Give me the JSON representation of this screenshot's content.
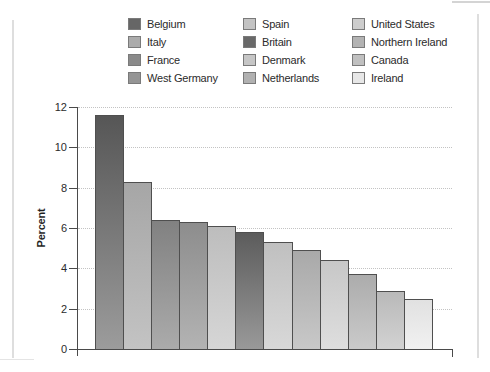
{
  "figure": {
    "ylabel": "Percent"
  },
  "legend": {
    "columns": [
      [
        "Belgium",
        "Italy",
        "France",
        "West Germany"
      ],
      [
        "Spain",
        "Britain",
        "Denmark",
        "Netherlands"
      ],
      [
        "United States",
        "Northern Ireland",
        "Canada",
        "Ireland"
      ]
    ]
  },
  "colors": {
    "Belgium": {
      "swatch": "#666666",
      "bar_top": "#565656",
      "bar_bottom": "#9c9c9c"
    },
    "Italy": {
      "swatch": "#ababab",
      "bar_top": "#a6a6a6",
      "bar_bottom": "#c3c3c3"
    },
    "France": {
      "swatch": "#8a8a8a",
      "bar_top": "#818181",
      "bar_bottom": "#ababab"
    },
    "West Germany": {
      "swatch": "#959595",
      "bar_top": "#8d8d8d",
      "bar_bottom": "#b3b3b3"
    },
    "Spain": {
      "swatch": "#c3c3c3",
      "bar_top": "#bdbdbd",
      "bar_bottom": "#d6d6d6"
    },
    "Britain": {
      "swatch": "#696969",
      "bar_top": "#5c5c5c",
      "bar_bottom": "#999999"
    },
    "Denmark": {
      "swatch": "#c6c6c6",
      "bar_top": "#c0c0c0",
      "bar_bottom": "#d8d8d8"
    },
    "Netherlands": {
      "swatch": "#b1b1b1",
      "bar_top": "#a9a9a9",
      "bar_bottom": "#c8c8c8"
    },
    "United States": {
      "swatch": "#cdcdcd",
      "bar_top": "#c7c7c7",
      "bar_bottom": "#dedede"
    },
    "Northern Ireland": {
      "swatch": "#b3b3b3",
      "bar_top": "#acacac",
      "bar_bottom": "#cacaca"
    },
    "Canada": {
      "swatch": "#c0c0c0",
      "bar_top": "#b9b9b9",
      "bar_bottom": "#d2d2d2"
    },
    "Ireland": {
      "swatch": "#e7e7e7",
      "bar_top": "#e1e1e1",
      "bar_bottom": "#f1f1f1"
    }
  },
  "chart_data": {
    "type": "bar",
    "categories": [
      "Belgium",
      "Italy",
      "France",
      "West Germany",
      "Spain",
      "Britain",
      "Denmark",
      "Netherlands",
      "United States",
      "Northern Ireland",
      "Canada",
      "Ireland"
    ],
    "values": [
      11.6,
      8.3,
      6.4,
      6.3,
      6.1,
      5.8,
      5.3,
      4.9,
      4.4,
      3.7,
      2.9,
      2.5
    ],
    "title": "",
    "xlabel": "",
    "ylabel": "Percent",
    "ylim": [
      0,
      12
    ],
    "yticks": [
      0,
      2,
      4,
      6,
      8,
      10,
      12
    ],
    "grid": true,
    "gridstyle": "dotted",
    "legend_position": "top",
    "bar_gap": 0
  }
}
